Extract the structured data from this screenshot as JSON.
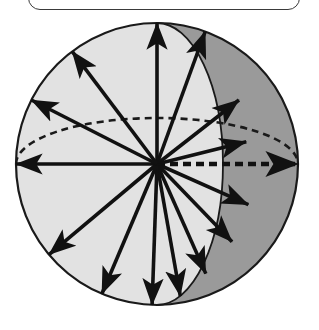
{
  "figure": {
    "background_color": "#ffffff",
    "canvas": {
      "width": 319,
      "height": 330
    }
  },
  "top_frame": {
    "name": "rounded-rectangle-frame",
    "stroke_color": "#3a3a3a",
    "fill_color": "#ffffff",
    "x": 28,
    "y": -26,
    "width": 272,
    "height": 36,
    "corner_radius": 12
  },
  "sphere": {
    "center_x": 157,
    "center_y": 164,
    "radius": 141,
    "outline_color": "#1a1a1a",
    "outline_width": 2.2,
    "front_fill_color": "#e2e2e2",
    "back_fill_color": "#9a9a9a",
    "meridian": {
      "name": "solid-meridian-arc",
      "rx": 66,
      "ry": 141,
      "stroke_color": "#1a1a1a",
      "stroke_width": 1.8,
      "style": "solid"
    },
    "equator": {
      "name": "dashed-equator-ellipse",
      "rx": 141,
      "ry": 46,
      "stroke_color": "#1a1a1a",
      "stroke_width": 2.6,
      "style": "dashed",
      "dash_pattern": "7 5"
    }
  },
  "vectors": {
    "count": 16,
    "stroke_color": "#111111",
    "origin_label": "sphere-center",
    "items": [
      {
        "id": "vector-up",
        "angle_deg": -90,
        "length": 141,
        "head": "arrow"
      },
      {
        "id": "vector-up-right-steep",
        "angle_deg": -62,
        "length": 118,
        "head": "arrow"
      },
      {
        "id": "vector-up-right-mid",
        "angle_deg": -38,
        "length": 104,
        "head": "arrow"
      },
      {
        "id": "vector-right-up-shallow",
        "angle_deg": -14,
        "length": 92,
        "head": "arrow"
      },
      {
        "id": "vector-right-dashed",
        "angle_deg": 0,
        "length": 141,
        "head": "arrow",
        "style": "dashed"
      },
      {
        "id": "vector-right-down-shallow",
        "angle_deg": 24,
        "length": 100,
        "head": "arrow"
      },
      {
        "id": "vector-down-right-mid",
        "angle_deg": 46,
        "length": 108,
        "head": "arrow"
      },
      {
        "id": "vector-down-right-steep",
        "angle_deg": 66,
        "length": 120,
        "head": "arrow"
      },
      {
        "id": "vector-down-right-near",
        "angle_deg": 80,
        "length": 134,
        "head": "arrow"
      },
      {
        "id": "vector-down",
        "angle_deg": 92,
        "length": 141,
        "head": "arrow"
      },
      {
        "id": "vector-down-left-steep",
        "angle_deg": 113,
        "length": 141,
        "head": "arrow"
      },
      {
        "id": "vector-down-left-mid",
        "angle_deg": 140,
        "length": 141,
        "head": "arrow"
      },
      {
        "id": "vector-left",
        "angle_deg": 180,
        "length": 141,
        "head": "arrow"
      },
      {
        "id": "vector-up-left-shallow",
        "angle_deg": 207,
        "length": 141,
        "head": "arrow"
      },
      {
        "id": "vector-up-left-mid",
        "angle_deg": 233,
        "length": 141,
        "head": "arrow"
      },
      {
        "id": "vector-up-right-edge",
        "angle_deg": -70,
        "length": 141,
        "head": "arrow"
      }
    ]
  },
  "colors": {
    "ink": "#111111",
    "front_hemisphere": "#e2e2e2",
    "back_hemisphere": "#9a9a9a",
    "frame_stroke": "#3a3a3a",
    "page": "#ffffff"
  }
}
